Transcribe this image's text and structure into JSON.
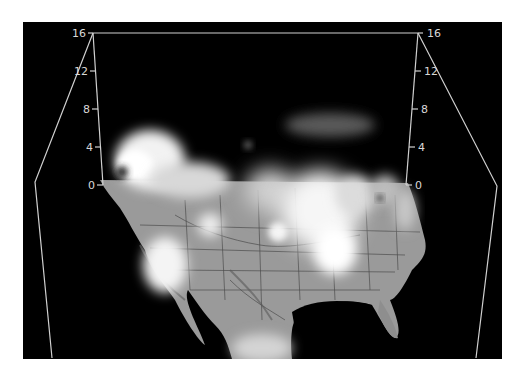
{
  "figure": {
    "background_color": "#000000",
    "frame_line_color": "#d0d0d0",
    "map_color": "#9a9a9a",
    "cloud_color": "#f2f2f2"
  },
  "axes": {
    "left": {
      "ticks": [
        {
          "label": "16",
          "y": 33
        },
        {
          "label": "12",
          "y": 71
        },
        {
          "label": "8",
          "y": 109
        },
        {
          "label": "4",
          "y": 147
        },
        {
          "label": "0",
          "y": 185
        }
      ]
    },
    "right": {
      "ticks": [
        {
          "label": "16",
          "y": 33
        },
        {
          "label": "12",
          "y": 71
        },
        {
          "label": "8",
          "y": 109
        },
        {
          "label": "4",
          "y": 147
        },
        {
          "label": "0",
          "y": 185
        }
      ]
    },
    "range": [
      0,
      16
    ],
    "tick_step": 4
  },
  "labels": {
    "l16": "16",
    "l12": "12",
    "l8": "8",
    "l4": "4",
    "l0": "0",
    "r16": "16",
    "r12": "12",
    "r8": "8",
    "r4": "4",
    "r0": "0"
  }
}
